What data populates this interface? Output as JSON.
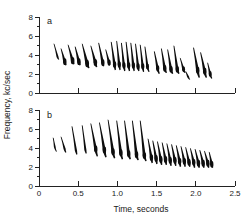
{
  "figure": {
    "title": "",
    "y_axis_title": "Frequency, kc/sec",
    "x_axis_title": "Time, seconds",
    "panel_a_label": "a",
    "panel_b_label": "b",
    "ink_color": "#0d0d0d",
    "axis_color": "#222222",
    "background_color": "#ffffff"
  },
  "chart_data": {
    "type": "line",
    "xlabel": "Time, seconds",
    "ylabel": "Frequency, kc/sec",
    "xlim": [
      0,
      2.5
    ],
    "ylim": [
      0,
      8
    ],
    "grid": false,
    "legend": "none",
    "xticks": [
      0,
      0.5,
      1.0,
      1.5,
      2.0,
      2.5
    ],
    "xtick_labels": [
      "0",
      "0.5",
      "1.0",
      "1.5",
      "2.0",
      "2.5"
    ],
    "yticks": [
      0,
      2,
      4,
      6,
      8
    ],
    "ytick_labels": [
      "0",
      "2",
      "4",
      "6",
      "8"
    ],
    "ytick_minor_step": 1,
    "panels": [
      {
        "label": "a",
        "description": "Song a: series of short downslurred notes descending in frequency across time",
        "notes": [
          {
            "t_start": 0.19,
            "t_end": 0.25,
            "f_high": 5.2,
            "f_low": 3.5,
            "peak_t": 0.235,
            "peak_f": 3.8,
            "weight": 0.45
          },
          {
            "t_start": 0.28,
            "t_end": 0.34,
            "f_high": 4.7,
            "f_low": 2.9,
            "peak_t": 0.325,
            "peak_f": 3.3,
            "weight": 0.8
          },
          {
            "t_start": 0.37,
            "t_end": 0.44,
            "f_high": 5.1,
            "f_low": 3.0,
            "peak_t": 0.425,
            "peak_f": 3.4,
            "weight": 0.9
          },
          {
            "t_start": 0.46,
            "t_end": 0.52,
            "f_high": 4.9,
            "f_low": 2.9,
            "peak_t": 0.505,
            "peak_f": 3.3,
            "weight": 0.85
          },
          {
            "t_start": 0.55,
            "t_end": 0.63,
            "f_high": 5.2,
            "f_low": 2.6,
            "peak_t": 0.61,
            "peak_f": 3.1,
            "weight": 1.0
          },
          {
            "t_start": 0.66,
            "t_end": 0.73,
            "f_high": 5.0,
            "f_low": 2.7,
            "peak_t": 0.715,
            "peak_f": 3.2,
            "weight": 0.9
          },
          {
            "t_start": 0.76,
            "t_end": 0.82,
            "f_high": 5.3,
            "f_low": 2.8,
            "peak_t": 0.81,
            "peak_f": 3.2,
            "weight": 0.8
          },
          {
            "t_start": 0.85,
            "t_end": 0.9,
            "f_high": 4.6,
            "f_low": 2.9,
            "peak_t": 0.89,
            "peak_f": 3.2,
            "weight": 0.7
          },
          {
            "t_start": 0.92,
            "t_end": 0.97,
            "f_high": 5.4,
            "f_low": 2.4,
            "peak_t": 0.96,
            "peak_f": 3.0,
            "weight": 0.75
          },
          {
            "t_start": 0.99,
            "t_end": 1.03,
            "f_high": 5.5,
            "f_low": 2.4,
            "peak_t": 1.02,
            "peak_f": 3.0,
            "weight": 0.7
          },
          {
            "t_start": 1.05,
            "t_end": 1.09,
            "f_high": 5.3,
            "f_low": 2.3,
            "peak_t": 1.08,
            "peak_f": 2.9,
            "weight": 0.7
          },
          {
            "t_start": 1.11,
            "t_end": 1.15,
            "f_high": 5.4,
            "f_low": 2.3,
            "peak_t": 1.14,
            "peak_f": 2.9,
            "weight": 0.7
          },
          {
            "t_start": 1.17,
            "t_end": 1.21,
            "f_high": 5.3,
            "f_low": 2.3,
            "peak_t": 1.2,
            "peak_f": 2.9,
            "weight": 0.7
          },
          {
            "t_start": 1.23,
            "t_end": 1.27,
            "f_high": 5.2,
            "f_low": 2.3,
            "peak_t": 1.26,
            "peak_f": 2.8,
            "weight": 0.7
          },
          {
            "t_start": 1.29,
            "t_end": 1.33,
            "f_high": 5.1,
            "f_low": 2.2,
            "peak_t": 1.32,
            "peak_f": 2.8,
            "weight": 0.65
          },
          {
            "t_start": 1.35,
            "t_end": 1.4,
            "f_high": 4.9,
            "f_low": 2.2,
            "peak_t": 1.38,
            "peak_f": 2.8,
            "weight": 0.6
          },
          {
            "t_start": 1.47,
            "t_end": 1.53,
            "f_high": 4.4,
            "f_low": 2.0,
            "peak_t": 1.51,
            "peak_f": 2.6,
            "weight": 0.7
          },
          {
            "t_start": 1.56,
            "t_end": 1.62,
            "f_high": 4.7,
            "f_low": 2.1,
            "peak_t": 1.6,
            "peak_f": 2.6,
            "weight": 0.8
          },
          {
            "t_start": 1.64,
            "t_end": 1.7,
            "f_high": 4.6,
            "f_low": 2.0,
            "peak_t": 1.68,
            "peak_f": 2.5,
            "weight": 0.8
          },
          {
            "t_start": 1.72,
            "t_end": 1.78,
            "f_high": 5.0,
            "f_low": 2.0,
            "peak_t": 1.76,
            "peak_f": 2.5,
            "weight": 0.8
          },
          {
            "t_start": 1.8,
            "t_end": 1.86,
            "f_high": 3.7,
            "f_low": 2.1,
            "peak_t": 1.84,
            "peak_f": 2.5,
            "weight": 0.6
          },
          {
            "t_start": 1.87,
            "t_end": 1.92,
            "f_high": 2.3,
            "f_low": 1.4,
            "peak_t": 1.9,
            "peak_f": 1.7,
            "weight": 0.5
          },
          {
            "t_start": 1.97,
            "t_end": 2.04,
            "f_high": 4.8,
            "f_low": 1.6,
            "peak_t": 2.02,
            "peak_f": 2.4,
            "weight": 0.85
          },
          {
            "t_start": 2.06,
            "t_end": 2.13,
            "f_high": 4.3,
            "f_low": 1.6,
            "peak_t": 2.11,
            "peak_f": 2.3,
            "weight": 0.85
          },
          {
            "t_start": 2.15,
            "t_end": 2.2,
            "f_high": 3.2,
            "f_low": 1.5,
            "peak_t": 2.18,
            "peak_f": 2.0,
            "weight": 0.6
          }
        ]
      },
      {
        "label": "b",
        "description": "Song b: introductory notes then a long descending trill of repeated notes",
        "notes": [
          {
            "t_start": 0.18,
            "t_end": 0.22,
            "f_high": 5.1,
            "f_low": 3.6,
            "peak_t": 0.2,
            "peak_f": 4.1,
            "weight": 0.35
          },
          {
            "t_start": 0.28,
            "t_end": 0.34,
            "f_high": 5.2,
            "f_low": 3.5,
            "peak_t": 0.325,
            "peak_f": 3.9,
            "weight": 0.5
          },
          {
            "t_start": 0.42,
            "t_end": 0.48,
            "f_high": 6.3,
            "f_low": 3.3,
            "peak_t": 0.47,
            "peak_f": 3.7,
            "weight": 0.55
          },
          {
            "t_start": 0.55,
            "t_end": 0.6,
            "f_high": 6.4,
            "f_low": 3.4,
            "peak_t": 0.59,
            "peak_f": 3.8,
            "weight": 0.5
          },
          {
            "t_start": 0.66,
            "t_end": 0.74,
            "f_high": 6.6,
            "f_low": 3.1,
            "peak_t": 0.72,
            "peak_f": 3.9,
            "weight": 0.8
          },
          {
            "t_start": 0.77,
            "t_end": 0.85,
            "f_high": 6.7,
            "f_low": 3.0,
            "peak_t": 0.83,
            "peak_f": 3.8,
            "weight": 0.85
          },
          {
            "t_start": 0.88,
            "t_end": 0.96,
            "f_high": 7.0,
            "f_low": 2.9,
            "peak_t": 0.94,
            "peak_f": 3.6,
            "weight": 0.85
          },
          {
            "t_start": 0.99,
            "t_end": 1.06,
            "f_high": 6.9,
            "f_low": 2.8,
            "peak_t": 1.04,
            "peak_f": 3.5,
            "weight": 0.85
          },
          {
            "t_start": 1.09,
            "t_end": 1.16,
            "f_high": 6.9,
            "f_low": 2.8,
            "peak_t": 1.14,
            "peak_f": 3.4,
            "weight": 0.85
          },
          {
            "t_start": 1.19,
            "t_end": 1.26,
            "f_high": 6.9,
            "f_low": 2.7,
            "peak_t": 1.24,
            "peak_f": 3.3,
            "weight": 0.85
          },
          {
            "t_start": 1.29,
            "t_end": 1.36,
            "f_high": 6.9,
            "f_low": 2.6,
            "peak_t": 1.34,
            "peak_f": 3.2,
            "weight": 0.85
          },
          {
            "t_start": 1.39,
            "t_end": 1.44,
            "f_high": 5.0,
            "f_low": 2.4,
            "peak_t": 1.43,
            "peak_f": 3.0,
            "weight": 0.8
          },
          {
            "t_start": 1.45,
            "t_end": 1.5,
            "f_high": 4.8,
            "f_low": 2.3,
            "peak_t": 1.49,
            "peak_f": 2.9,
            "weight": 0.8
          },
          {
            "t_start": 1.51,
            "t_end": 1.56,
            "f_high": 4.7,
            "f_low": 2.2,
            "peak_t": 1.55,
            "peak_f": 2.8,
            "weight": 0.8
          },
          {
            "t_start": 1.57,
            "t_end": 1.62,
            "f_high": 4.6,
            "f_low": 2.2,
            "peak_t": 1.61,
            "peak_f": 2.8,
            "weight": 0.8
          },
          {
            "t_start": 1.63,
            "t_end": 1.68,
            "f_high": 4.5,
            "f_low": 2.1,
            "peak_t": 1.67,
            "peak_f": 2.7,
            "weight": 0.8
          },
          {
            "t_start": 1.69,
            "t_end": 1.74,
            "f_high": 4.4,
            "f_low": 2.1,
            "peak_t": 1.73,
            "peak_f": 2.7,
            "weight": 0.8
          },
          {
            "t_start": 1.75,
            "t_end": 1.8,
            "f_high": 4.3,
            "f_low": 2.0,
            "peak_t": 1.79,
            "peak_f": 2.6,
            "weight": 0.8
          },
          {
            "t_start": 1.81,
            "t_end": 1.86,
            "f_high": 4.2,
            "f_low": 2.0,
            "peak_t": 1.85,
            "peak_f": 2.6,
            "weight": 0.8
          },
          {
            "t_start": 1.87,
            "t_end": 1.92,
            "f_high": 4.1,
            "f_low": 2.0,
            "peak_t": 1.91,
            "peak_f": 2.5,
            "weight": 0.8
          },
          {
            "t_start": 1.93,
            "t_end": 1.98,
            "f_high": 4.0,
            "f_low": 1.9,
            "peak_t": 1.97,
            "peak_f": 2.5,
            "weight": 0.8
          },
          {
            "t_start": 1.99,
            "t_end": 2.04,
            "f_high": 3.9,
            "f_low": 1.9,
            "peak_t": 2.03,
            "peak_f": 2.4,
            "weight": 0.8
          },
          {
            "t_start": 2.05,
            "t_end": 2.1,
            "f_high": 3.8,
            "f_low": 1.9,
            "peak_t": 2.09,
            "peak_f": 2.4,
            "weight": 0.8
          },
          {
            "t_start": 2.11,
            "t_end": 2.16,
            "f_high": 3.7,
            "f_low": 1.9,
            "peak_t": 2.15,
            "peak_f": 2.4,
            "weight": 0.8
          },
          {
            "t_start": 2.17,
            "t_end": 2.21,
            "f_high": 3.6,
            "f_low": 1.9,
            "peak_t": 2.2,
            "peak_f": 2.3,
            "weight": 0.75
          }
        ]
      }
    ]
  }
}
